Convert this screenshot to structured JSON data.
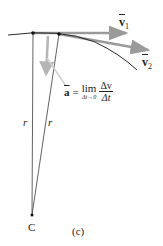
{
  "figure": {
    "panel_label": "(c)",
    "center_label": "C",
    "radius_labels": [
      "r",
      "r"
    ],
    "vectors": {
      "v1": {
        "symbol": "v",
        "subscript": "1"
      },
      "v2": {
        "symbol": "v",
        "subscript": "2"
      }
    },
    "formula": {
      "lhs": "a",
      "equals": "=",
      "lim_word": "lim",
      "lim_under": "Δt→0",
      "numerator": "Δv",
      "denominator": "Δt"
    },
    "colors": {
      "curve": "#2b2b2b",
      "radius_line": "#3a3a3a",
      "velocity_arrow": "#9a9a9a",
      "delta_v_arrow": "#b5b5b5",
      "pointer_line": "#cfcfcf",
      "text": "#222222"
    }
  }
}
